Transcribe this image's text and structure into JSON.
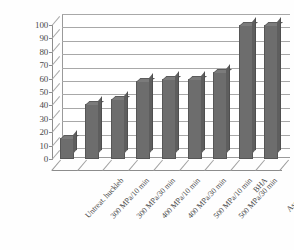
{
  "chart_data": {
    "type": "bar",
    "title": "",
    "subtitle": "",
    "xlabel": "",
    "ylabel": "",
    "categories": [
      "Untreat. huckleb",
      "300 MPa/10 min",
      "300 MPa/30 min",
      "400 MPa/10 min",
      "400 MPa/30 min",
      "500 MPa/10 min",
      "500 MPa/30 min",
      "BHA",
      "Ascorbic acid"
    ],
    "values": [
      16,
      41,
      45,
      58,
      60,
      60,
      65,
      100,
      100
    ],
    "ylim": [
      0,
      100
    ],
    "ytick_step": 10,
    "yticks": [
      0,
      10,
      20,
      30,
      40,
      50,
      60,
      70,
      80,
      90,
      100
    ],
    "ytick_labels": [
      "0",
      "10",
      "20",
      "30",
      "40",
      "50",
      "60",
      "70",
      "80",
      "90",
      "100"
    ],
    "grid": true,
    "grid_axis": "y",
    "legend": false,
    "legend_position": "none",
    "style": "3d-column",
    "series": [
      {
        "name": "",
        "values": [
          16,
          41,
          45,
          58,
          60,
          60,
          65,
          100,
          100
        ]
      }
    ]
  },
  "colors": {
    "bar_face": "#6d6d6d",
    "bar_top": "#7b7b7b",
    "bar_side": "#5e5e5e",
    "bar_edge": "#565656",
    "gridline": "#a8a8a8",
    "axis": "#8c8c8c",
    "text": "#4a4a4a",
    "background": "#fefefe"
  }
}
